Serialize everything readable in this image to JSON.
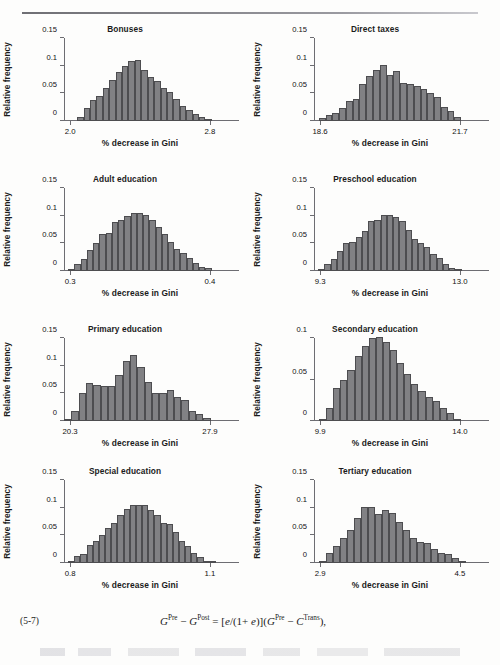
{
  "page": {
    "running_head": "",
    "equation_number": "(5-7)",
    "equation_plain": "G^Pre − G^Post = [e/(1+e)](G^Pre − C^Trans),"
  },
  "common": {
    "ylabel": "Relative frequency",
    "xlabel": "% decrease in Gini"
  },
  "chart_data": [
    {
      "type": "bar",
      "title": "Bonuses",
      "xlabel": "% decrease in Gini",
      "ylabel": "Relative frequency",
      "ylim": [
        0,
        0.15
      ],
      "yticks": [
        0,
        0.05,
        0.1,
        0.15
      ],
      "ytick_labels": [
        "0",
        "0.05",
        "0.1",
        "0.15"
      ],
      "xlim": [
        2.0,
        2.8
      ],
      "xticks": [
        2.0,
        2.8
      ],
      "xtick_labels": [
        "2.0",
        "2.8"
      ],
      "grid": false,
      "legend": "none",
      "values": [
        0.0,
        0.0,
        0.0,
        0.008,
        0.024,
        0.038,
        0.046,
        0.06,
        0.075,
        0.088,
        0.1,
        0.108,
        0.11,
        0.092,
        0.08,
        0.072,
        0.06,
        0.053,
        0.04,
        0.028,
        0.02,
        0.012,
        0.008,
        0.004,
        0.0
      ]
    },
    {
      "type": "bar",
      "title": "Direct taxes",
      "xlabel": "% decrease in Gini",
      "ylabel": "Relative frequency",
      "ylim": [
        0,
        0.15
      ],
      "yticks": [
        0,
        0.05,
        0.1,
        0.15
      ],
      "ytick_labels": [
        "0",
        "0.05",
        "0.1",
        "0.15"
      ],
      "xlim": [
        18.6,
        21.7
      ],
      "xticks": [
        18.6,
        21.7
      ],
      "xtick_labels": [
        "18.6",
        "21.7"
      ],
      "grid": false,
      "legend": "none",
      "values": [
        0.0,
        0.005,
        0.01,
        0.014,
        0.024,
        0.036,
        0.039,
        0.066,
        0.082,
        0.093,
        0.101,
        0.084,
        0.09,
        0.068,
        0.066,
        0.064,
        0.057,
        0.05,
        0.044,
        0.026,
        0.018,
        0.008,
        0.0
      ]
    },
    {
      "type": "bar",
      "title": "Adult education",
      "xlabel": "% decrease in Gini",
      "ylabel": "Relative frequency",
      "ylim": [
        0,
        0.15
      ],
      "yticks": [
        0,
        0.05,
        0.1,
        0.15
      ],
      "ytick_labels": [
        "0",
        "0.05",
        "0.1",
        "0.15"
      ],
      "xlim": [
        0.3,
        0.4
      ],
      "xticks": [
        0.3,
        0.4
      ],
      "xtick_labels": [
        "0.3",
        "0.4"
      ],
      "grid": false,
      "legend": "none",
      "values": [
        0.0,
        0.004,
        0.013,
        0.022,
        0.038,
        0.05,
        0.066,
        0.068,
        0.088,
        0.092,
        0.1,
        0.104,
        0.105,
        0.102,
        0.092,
        0.08,
        0.066,
        0.053,
        0.04,
        0.032,
        0.024,
        0.014,
        0.008,
        0.006,
        0.0
      ]
    },
    {
      "type": "bar",
      "title": "Preschool education",
      "xlabel": "% decrease in Gini",
      "ylabel": "Relative frequency",
      "ylim": [
        0,
        0.15
      ],
      "yticks": [
        0,
        0.05,
        0.1,
        0.15
      ],
      "ytick_labels": [
        "0",
        "0.05",
        "0.1",
        "0.15"
      ],
      "xlim": [
        9.3,
        13.0
      ],
      "xticks": [
        9.3,
        13.0
      ],
      "xtick_labels": [
        "9.3",
        "13.0"
      ],
      "grid": false,
      "legend": "none",
      "values": [
        0.0,
        0.001,
        0.012,
        0.022,
        0.036,
        0.05,
        0.052,
        0.062,
        0.073,
        0.09,
        0.093,
        0.101,
        0.102,
        0.098,
        0.09,
        0.075,
        0.057,
        0.05,
        0.043,
        0.03,
        0.023,
        0.013,
        0.005,
        0.004,
        0.0
      ]
    },
    {
      "type": "bar",
      "title": "Primary education",
      "xlabel": "% decrease in Gini",
      "ylabel": "Relative frequency",
      "ylim": [
        0,
        0.15
      ],
      "yticks": [
        0,
        0.05,
        0.1,
        0.15
      ],
      "ytick_labels": [
        "0",
        "0.05",
        "0.1",
        "0.15"
      ],
      "xlim": [
        20.3,
        27.9
      ],
      "xticks": [
        20.3,
        27.9
      ],
      "xtick_labels": [
        "20.3",
        "27.9"
      ],
      "grid": false,
      "legend": "none",
      "values": [
        0.004,
        0.019,
        0.051,
        0.069,
        0.065,
        0.063,
        0.064,
        0.083,
        0.109,
        0.119,
        0.098,
        0.071,
        0.051,
        0.051,
        0.056,
        0.044,
        0.038,
        0.019,
        0.013,
        0.005,
        0.0
      ]
    },
    {
      "type": "bar",
      "title": "Secondary education",
      "xlabel": "% decrease in Gini",
      "ylabel": "Relative frequency",
      "ylim": [
        0,
        0.1
      ],
      "yticks": [
        0,
        0.05,
        0.1
      ],
      "ytick_labels": [
        "0",
        "0.05",
        "0.1"
      ],
      "xlim": [
        9.9,
        14.0
      ],
      "xticks": [
        9.9,
        14.0
      ],
      "xtick_labels": [
        "9.9",
        "14.0"
      ],
      "grid": false,
      "legend": "none",
      "values": [
        0.0,
        0.002,
        0.016,
        0.04,
        0.05,
        0.062,
        0.078,
        0.09,
        0.1,
        0.101,
        0.095,
        0.086,
        0.07,
        0.057,
        0.044,
        0.036,
        0.029,
        0.024,
        0.016,
        0.01,
        0.003,
        0.0
      ]
    },
    {
      "type": "bar",
      "title": "Special education",
      "xlabel": "% decrease in Gini",
      "ylabel": "Relative frequency",
      "ylim": [
        0,
        0.15
      ],
      "yticks": [
        0,
        0.05,
        0.1,
        0.15
      ],
      "ytick_labels": [
        "0",
        "0.05",
        "0.1",
        "0.15"
      ],
      "xlim": [
        0.8,
        1.1
      ],
      "xticks": [
        0.8,
        1.1
      ],
      "xtick_labels": [
        "0.8",
        "1.1"
      ],
      "grid": false,
      "legend": "none",
      "values": [
        0.0,
        0.003,
        0.012,
        0.016,
        0.033,
        0.04,
        0.05,
        0.063,
        0.073,
        0.086,
        0.097,
        0.104,
        0.105,
        0.104,
        0.096,
        0.086,
        0.072,
        0.07,
        0.056,
        0.04,
        0.03,
        0.019,
        0.011,
        0.004,
        0.002
      ]
    },
    {
      "type": "bar",
      "title": "Tertiary education",
      "xlabel": "% decrease in Gini",
      "ylabel": "Relative frequency",
      "ylim": [
        0,
        0.15
      ],
      "yticks": [
        0,
        0.05,
        0.1,
        0.15
      ],
      "ytick_labels": [
        "0",
        "0.05",
        "0.1",
        "0.15"
      ],
      "xlim": [
        2.9,
        4.5
      ],
      "xticks": [
        2.9,
        4.5
      ],
      "xtick_labels": [
        "2.9",
        "4.5"
      ],
      "grid": false,
      "legend": "none",
      "values": [
        0.0,
        0.003,
        0.018,
        0.03,
        0.046,
        0.06,
        0.081,
        0.101,
        0.102,
        0.089,
        0.096,
        0.091,
        0.074,
        0.059,
        0.046,
        0.038,
        0.036,
        0.026,
        0.018,
        0.017,
        0.009,
        0.004
      ]
    }
  ]
}
